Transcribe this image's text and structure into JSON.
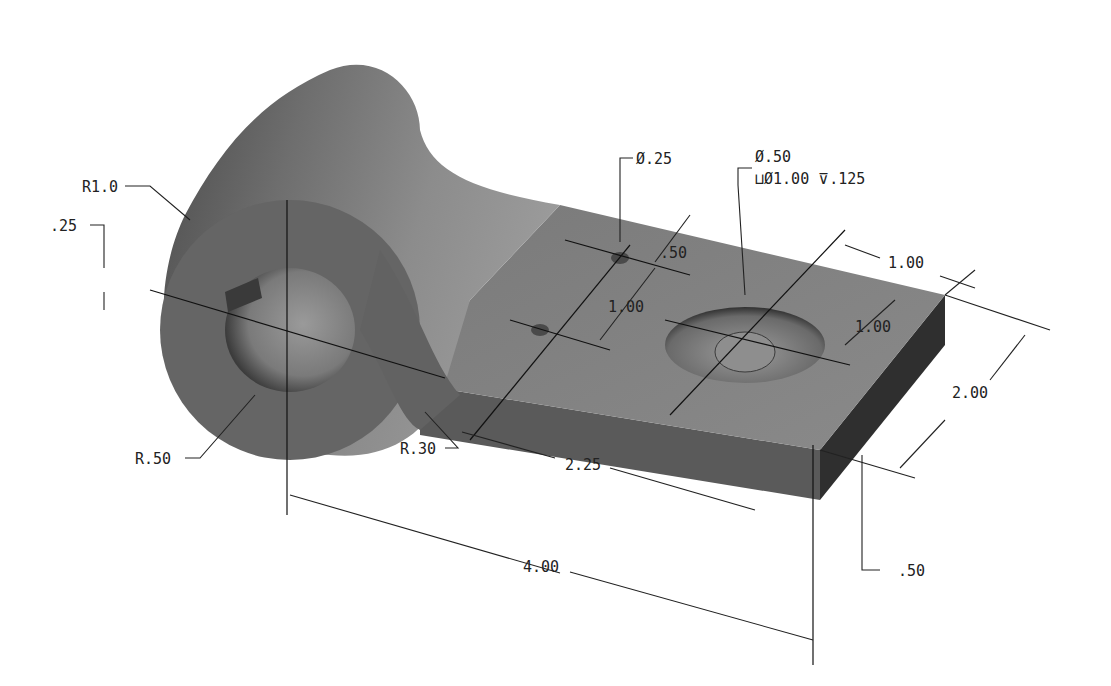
{
  "drawing": {
    "type": "isometric-part-drawing",
    "colors": {
      "background": "#ffffff",
      "surface_light": "#8a8a8a",
      "surface_mid": "#6c6c6c",
      "surface_dark": "#3a3a3a",
      "annotation": "#222222"
    },
    "dimensions": {
      "boss_outer_radius": "R1.0",
      "slot_width": ".25",
      "bore_radius": "R.50",
      "fillet_radius": "R.30",
      "small_hole_dia": "Ø.25",
      "small_hole_offset": ".50",
      "small_hole_spacing": "1.00",
      "cbore_hole_dia": "Ø.50",
      "cbore_callout": "⊔Ø1.00 ⊽.125",
      "cbore_from_end": "1.00",
      "cbore_from_edge": "1.00",
      "plate_width": "2.00",
      "plate_thickness": ".50",
      "plate_length": "2.25",
      "overall_length": "4.00"
    }
  }
}
